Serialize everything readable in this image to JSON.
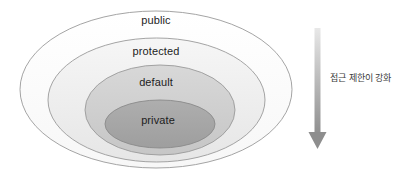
{
  "diagram": {
    "type": "nested-ellipse-venn",
    "rings": [
      {
        "id": "public",
        "label": "public",
        "fill": "#fdfdfd",
        "stroke": "#9a9a9a",
        "order": 1,
        "scope": "outermost"
      },
      {
        "id": "protected",
        "label": "protected",
        "fill": "#eeeeee",
        "stroke": "#9a9a9a",
        "order": 2,
        "scope": "second"
      },
      {
        "id": "default",
        "label": "default",
        "fill": "#cfcfcf",
        "stroke": "#9a9a9a",
        "order": 3,
        "scope": "third"
      },
      {
        "id": "private",
        "label": "private",
        "fill": "#a6a6a6",
        "stroke": "#8a8a8a",
        "order": 4,
        "scope": "innermost"
      }
    ],
    "annotation": {
      "arrow_direction": "down",
      "caption": "접근 제한이 강화",
      "arrow_color_top": "#e2e2e2",
      "arrow_color_bottom": "#8c8c8c"
    },
    "background": "#ffffff"
  }
}
